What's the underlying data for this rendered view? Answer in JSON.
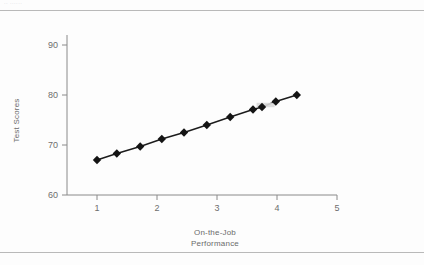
{
  "page": {
    "header_scrap": "·· ······",
    "rules": [
      "top-rule",
      "bottom-rule"
    ]
  },
  "labels": {
    "x_title_line1": "On-the-Job",
    "x_title_line2": "Performance",
    "y_title": "Test Scores"
  },
  "chart_data": {
    "type": "line",
    "title": "",
    "xlabel": "On-the-Job Performance",
    "ylabel": "Test Scores",
    "xlim": [
      0.5,
      5.0
    ],
    "ylim": [
      60,
      92
    ],
    "xticks": [
      1,
      2,
      3,
      4,
      5
    ],
    "yticks": [
      60,
      70,
      80,
      90
    ],
    "xticklabels": [
      "1",
      "2",
      "3",
      "4",
      "5"
    ],
    "yticklabels": [
      "60",
      "70",
      "80",
      "90"
    ],
    "grid": false,
    "legend": false,
    "marker": "diamond",
    "marker_color": "#141414",
    "line_color": "#1c1c1c",
    "series": [
      {
        "name": "Test Scores vs On-the-Job Performance",
        "points": [
          {
            "x": 1.0,
            "y": 67.0
          },
          {
            "x": 1.33,
            "y": 68.3
          },
          {
            "x": 1.72,
            "y": 69.7
          },
          {
            "x": 2.08,
            "y": 71.2
          },
          {
            "x": 2.45,
            "y": 72.5
          },
          {
            "x": 2.83,
            "y": 74.0
          },
          {
            "x": 3.22,
            "y": 75.6
          },
          {
            "x": 3.6,
            "y": 77.1
          },
          {
            "x": 3.75,
            "y": 77.6
          },
          {
            "x": 3.98,
            "y": 78.7
          },
          {
            "x": 4.33,
            "y": 80.0
          }
        ]
      }
    ]
  }
}
